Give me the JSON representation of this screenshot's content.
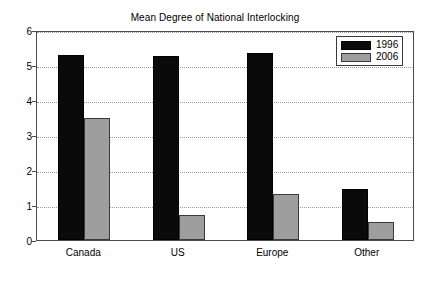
{
  "chart_data": {
    "type": "bar",
    "title": "Mean Degree of National Interlocking",
    "xlabel": "",
    "ylabel": "",
    "categories": [
      "Canada",
      "US",
      "Europe",
      "Other"
    ],
    "series": [
      {
        "name": "1996",
        "color": "#0a0a0a",
        "values": [
          5.3,
          5.25,
          5.35,
          1.45
        ]
      },
      {
        "name": "2006",
        "color": "#9e9e9e",
        "values": [
          3.5,
          0.72,
          1.32,
          0.52
        ]
      }
    ],
    "ylim": [
      0,
      6
    ],
    "yticks": [
      0,
      1,
      2,
      3,
      4,
      5,
      6
    ],
    "ytick_labels": [
      "0",
      "1",
      "2",
      "3",
      "4",
      "5",
      "6"
    ],
    "grid": true,
    "grid_axis": "y",
    "grid_style": "dotted",
    "legend_position": "top-right",
    "legend_entries": [
      "1996",
      "2006"
    ]
  }
}
